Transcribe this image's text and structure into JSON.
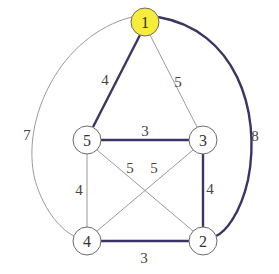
{
  "colors": {
    "highlight_node": "#f7eb3c",
    "node_fill": "#ffffff",
    "thick_edge": "#3b3566",
    "thin_edge": "#9a9a9a"
  },
  "nodes": [
    {
      "id": "1",
      "label": "1",
      "x": 145,
      "y": 22,
      "highlighted": true
    },
    {
      "id": "2",
      "label": "2",
      "x": 203,
      "y": 241,
      "highlighted": false
    },
    {
      "id": "3",
      "label": "3",
      "x": 203,
      "y": 140,
      "highlighted": false
    },
    {
      "id": "4",
      "label": "4",
      "x": 87,
      "y": 241,
      "highlighted": false
    },
    {
      "id": "5",
      "label": "5",
      "x": 87,
      "y": 140,
      "highlighted": false
    }
  ],
  "edges": [
    {
      "from": "1",
      "to": "5",
      "weight": "4",
      "thick": true
    },
    {
      "from": "1",
      "to": "3",
      "weight": "5",
      "thick": false
    },
    {
      "from": "1",
      "to": "4",
      "weight": "7",
      "thick": false,
      "curved": true
    },
    {
      "from": "1",
      "to": "2",
      "weight": "8",
      "thick": true,
      "curved": true
    },
    {
      "from": "5",
      "to": "3",
      "weight": "3",
      "thick": true
    },
    {
      "from": "5",
      "to": "4",
      "weight": "4",
      "thick": false
    },
    {
      "from": "5",
      "to": "2",
      "weight": "5",
      "thick": false
    },
    {
      "from": "3",
      "to": "4",
      "weight": "5",
      "thick": false
    },
    {
      "from": "3",
      "to": "2",
      "weight": "4",
      "thick": true
    },
    {
      "from": "4",
      "to": "2",
      "weight": "3",
      "thick": true
    }
  ]
}
